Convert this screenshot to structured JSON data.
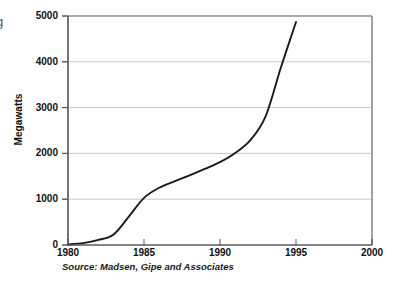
{
  "figure": {
    "edge_glyph": "g",
    "source_note": "Source: Madsen, Gipe and Associates",
    "background_color": "#ffffff",
    "frame_color": "#8c8c8c",
    "grid_color": "#c8c8c8",
    "line_color": "#1a1a1a"
  },
  "chart_data": {
    "type": "line",
    "title": "",
    "subtitle": "",
    "xlabel": "",
    "ylabel": "Megawatts",
    "xlim": [
      1980,
      2000
    ],
    "ylim": [
      0,
      5000
    ],
    "grid": true,
    "grid_axis": "y",
    "legend": false,
    "legend_position": "none",
    "annotations": [
      "Source: Madsen, Gipe and Associates"
    ],
    "xticks": [
      1980,
      1985,
      1990,
      1995,
      2000
    ],
    "xtick_labels": [
      "1980",
      "1985",
      "1990",
      "1995",
      "2000"
    ],
    "yticks": [
      0,
      1000,
      2000,
      3000,
      4000,
      5000
    ],
    "ytick_labels": [
      "0",
      "1000",
      "2000",
      "3000",
      "4000",
      "5000"
    ],
    "series": [
      {
        "name": "Installed wind capacity",
        "x": [
          1980,
          1981,
          1982,
          1983,
          1984,
          1985,
          1986,
          1987,
          1988,
          1989,
          1990,
          1991,
          1992,
          1993,
          1994,
          1995
        ],
        "values": [
          10,
          40,
          110,
          230,
          620,
          1030,
          1250,
          1390,
          1520,
          1660,
          1810,
          2010,
          2290,
          2810,
          3870,
          4870
        ]
      }
    ]
  }
}
